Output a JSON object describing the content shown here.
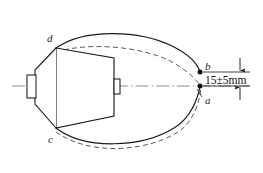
{
  "figure": {
    "type": "engineering-drawing",
    "background_color": "#ffffff",
    "line_color": "#1a1a1a",
    "dashed_color": "#555555",
    "centerline_color": "#777777"
  },
  "labels": {
    "point_d": "d",
    "point_c": "c",
    "point_b": "b",
    "point_a": "a"
  },
  "dimension": {
    "text": "15±5mm",
    "value": 15,
    "tolerance": 5,
    "unit": "mm"
  },
  "geometry": {
    "axis_y": 86,
    "point_b": {
      "x": 200,
      "y": 72
    },
    "point_a": {
      "x": 200,
      "y": 86
    },
    "point_d": {
      "x": 56,
      "y": 48
    },
    "point_c": {
      "x": 56,
      "y": 128
    },
    "body": "trapezoid",
    "nose": "left-taper-with-tab",
    "tab_right": "small-rectangle"
  }
}
